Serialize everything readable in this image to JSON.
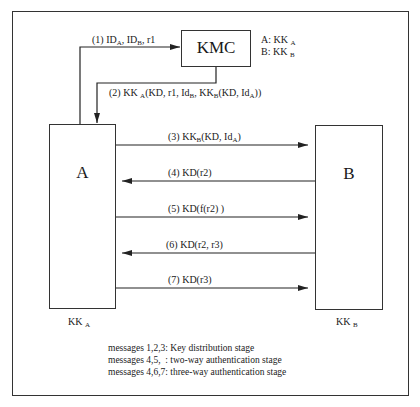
{
  "diagram": {
    "entities": {
      "kmc": {
        "label": "KMC"
      },
      "a": {
        "label": "A",
        "key_main": "KK",
        "key_sub": "A"
      },
      "b": {
        "label": "B",
        "key_main": "KK",
        "key_sub": "B"
      }
    },
    "kmc_keys": [
      {
        "prefix": "A:  KK",
        "sub": "A"
      },
      {
        "prefix": "B:  KK",
        "sub": "B"
      }
    ],
    "messages": [
      {
        "id": 1,
        "parts": [
          "(1) ID",
          "A",
          ", ID",
          "B",
          ", r1"
        ],
        "from": "A",
        "to": "KMC"
      },
      {
        "id": 2,
        "parts": [
          "(2) KK",
          "A",
          "(KD, r1, Id",
          "B",
          ", KK",
          "B",
          "(KD, Id",
          "A",
          "))"
        ],
        "from": "KMC",
        "to": "A"
      },
      {
        "id": 3,
        "parts": [
          "(3) KK",
          "B",
          "(KD, Id",
          "A",
          ")"
        ],
        "from": "A",
        "to": "B"
      },
      {
        "id": 4,
        "text": "(4) KD(r2)",
        "from": "B",
        "to": "A"
      },
      {
        "id": 5,
        "text": "(5) KD(f(r2) )",
        "from": "A",
        "to": "B"
      },
      {
        "id": 6,
        "text": "(6) KD(r2, r3)",
        "from": "B",
        "to": "A"
      },
      {
        "id": 7,
        "text": "(7) KD(r3)",
        "from": "A",
        "to": "B"
      }
    ],
    "legend": [
      "messages 1,2,3: Key distribution stage",
      "messages 4,5,  : two-way authentication stage",
      "messages 4,6,7: three-way authentication stage"
    ]
  }
}
